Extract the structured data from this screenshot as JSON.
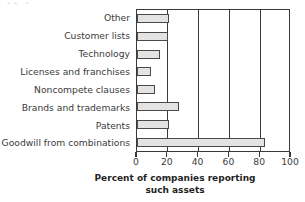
{
  "chart_data": {
    "type": "bar",
    "orientation": "horizontal",
    "title": "",
    "xlabel": "Percent of companies reporting such assets",
    "xlabel_lines": [
      "Percent of companies reporting",
      "such assets"
    ],
    "ylabel": "",
    "categories": [
      "Other",
      "Customer lists",
      "Technology",
      "Licenses and franchises",
      "Noncompete clauses",
      "Brands and trademarks",
      "Patents",
      "Goodwill from combinations"
    ],
    "values": [
      20.5,
      20,
      15,
      9,
      12,
      27,
      21,
      83
    ],
    "xlim": [
      0,
      100
    ],
    "xticks": [
      0,
      20,
      40,
      60,
      80,
      100
    ],
    "xtick_labels": [
      "0",
      "20",
      "40",
      "60",
      "80",
      "100"
    ],
    "gridlines": [
      20,
      40,
      60,
      80
    ],
    "grid": true,
    "legend": null,
    "bar_fill_color": "#e3e3e3",
    "bar_edge_color": "#4a4a4a",
    "axis_color": "#3a3a3a",
    "background_color": "#ffffff"
  },
  "top_remnant": "∙∙          ∘"
}
